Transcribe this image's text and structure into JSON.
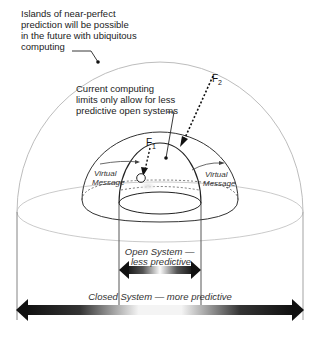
{
  "annotations": {
    "outer_note": [
      "Islands of near-perfect",
      "prediction will be possible",
      "in the future with ubiquitous",
      "computing"
    ],
    "inner_note": [
      "Current computing",
      "limits only allow for less",
      "predictive open systems"
    ]
  },
  "forces": {
    "f1": {
      "letter": "F",
      "sub": "1"
    },
    "f2": {
      "letter": "F",
      "sub": "2"
    }
  },
  "messages": {
    "left": [
      "Virtual",
      "Message"
    ],
    "right": [
      "Virtual",
      "Message"
    ]
  },
  "ranges": {
    "open": [
      "Open System —",
      "less predictive"
    ],
    "closed": "Closed System — more predictive"
  },
  "colors": {
    "outer_dome": "#b8b8b8",
    "inner_line": "#333333",
    "arrow_dark": "#111111",
    "arrow_light": "#ffffff"
  }
}
